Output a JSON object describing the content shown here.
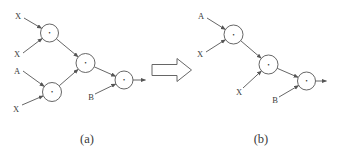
{
  "figure": {
    "background": "#ffffff",
    "line_color": "#555555",
    "text_color": "#3a3a3a",
    "transform_arrow_icon": "hollow-right-block-arrow",
    "panel_a": {
      "caption": "(a)",
      "labels": {
        "input1": "X",
        "input2": "X",
        "input3": "A",
        "input4": "X",
        "input5": "B"
      },
      "nodes": [
        "•",
        "•",
        "•",
        "•"
      ]
    },
    "panel_b": {
      "caption": "(b)",
      "labels": {
        "input1": "A",
        "input2": "X",
        "input3": "X",
        "input4": "B"
      },
      "nodes": [
        "•",
        "•",
        "•"
      ]
    }
  }
}
